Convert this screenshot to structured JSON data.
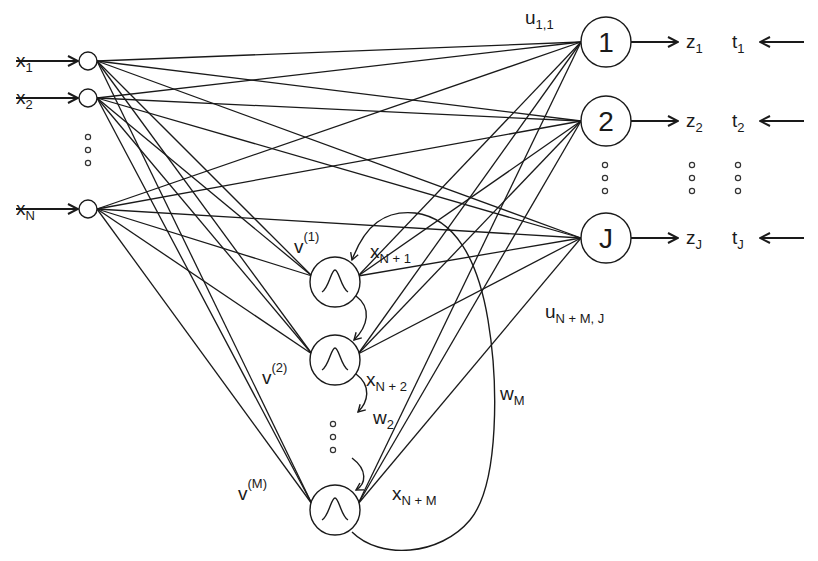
{
  "diagram": {
    "colors": {
      "stroke": "#1a1a1a",
      "background": "#ffffff"
    },
    "inputs": [
      {
        "id": "x1",
        "label": "x",
        "sub": "1",
        "cx": 88,
        "cy": 61
      },
      {
        "id": "x2",
        "label": "x",
        "sub": "2",
        "cx": 88,
        "cy": 98
      },
      {
        "id": "xN",
        "label": "x",
        "sub": "N",
        "cx": 88,
        "cy": 209
      }
    ],
    "input_ellipsis": {
      "x": 88,
      "ys": [
        137,
        150,
        163
      ]
    },
    "hidden": [
      {
        "id": "h1",
        "cx": 335,
        "cy": 282,
        "weight_label": "v",
        "weight_sup": "(1)",
        "state_label": "x",
        "state_sub": "N + 1"
      },
      {
        "id": "h2",
        "cx": 335,
        "cy": 360,
        "weight_label": "v",
        "weight_sup": "(2)",
        "state_label": "x",
        "state_sub": "N + 2"
      },
      {
        "id": "hM",
        "cx": 335,
        "cy": 510,
        "weight_label": "v",
        "weight_sup": "(M)",
        "state_label": "x",
        "state_sub": "N + M"
      }
    ],
    "hidden_ellipsis": {
      "x": 333,
      "ys": [
        424,
        437,
        450
      ]
    },
    "hidden_icon": "gaussian-bump-icon",
    "outputs": [
      {
        "id": "o1",
        "label": "1",
        "cx": 606,
        "cy": 42,
        "z": "z",
        "z_sub": "1",
        "t": "t",
        "t_sub": "1"
      },
      {
        "id": "o2",
        "label": "2",
        "cx": 606,
        "cy": 121,
        "z": "z",
        "z_sub": "2",
        "t": "t",
        "t_sub": "2"
      },
      {
        "id": "oJ",
        "label": "J",
        "cx": 606,
        "cy": 238,
        "z": "z",
        "z_sub": "J",
        "t": "t",
        "t_sub": "J"
      }
    ],
    "output_ellipsis": {
      "xs": [
        605,
        692,
        738
      ],
      "ys": [
        165,
        178,
        191
      ]
    },
    "weight_labels": {
      "u_first": {
        "label": "u",
        "sub": "1,1"
      },
      "u_last": {
        "label": "u",
        "sub": "N + M, J"
      },
      "w2": {
        "label": "w",
        "sub": "2"
      },
      "wM": {
        "label": "w",
        "sub": "M"
      }
    }
  }
}
